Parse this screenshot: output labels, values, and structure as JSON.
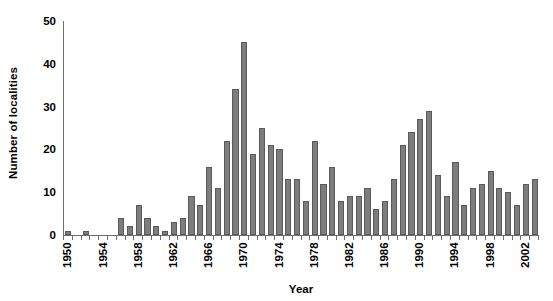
{
  "chart_data": {
    "type": "bar",
    "title": "",
    "xlabel": "Year",
    "ylabel": "Number of localities",
    "xlim": [
      1949.5,
      2003.5
    ],
    "ylim": [
      0,
      50
    ],
    "yticks": [
      0,
      10,
      20,
      30,
      40,
      50
    ],
    "xticks": [
      1950,
      1954,
      1958,
      1962,
      1966,
      1970,
      1974,
      1978,
      1982,
      1986,
      1990,
      1994,
      1998,
      2002
    ],
    "xtick_labels": [
      "1950",
      "1954",
      "1958",
      "1962",
      "1966",
      "1970",
      "1974",
      "1978",
      "1982",
      "1986",
      "1990",
      "1994",
      "1998",
      "2002"
    ],
    "ytick_labels": [
      "0",
      "10",
      "20",
      "30",
      "40",
      "50"
    ],
    "grid": false,
    "legend": null,
    "bar_color": "#7d7d7d",
    "bar_edge_color": "#5a5a5a",
    "axis_color": "#6e6e6e",
    "categories": [
      "1950",
      "1951",
      "1952",
      "1953",
      "1954",
      "1955",
      "1956",
      "1957",
      "1958",
      "1959",
      "1960",
      "1961",
      "1962",
      "1963",
      "1964",
      "1965",
      "1966",
      "1967",
      "1968",
      "1969",
      "1970",
      "1971",
      "1972",
      "1973",
      "1974",
      "1975",
      "1976",
      "1977",
      "1978",
      "1979",
      "1980",
      "1981",
      "1982",
      "1983",
      "1984",
      "1985",
      "1986",
      "1987",
      "1988",
      "1989",
      "1990",
      "1991",
      "1992",
      "1993",
      "1994",
      "1995",
      "1996",
      "1997",
      "1998",
      "1999",
      "2000",
      "2001",
      "2002",
      "2003"
    ],
    "values": [
      1,
      0,
      1,
      0,
      0,
      0,
      4,
      2,
      7,
      4,
      2,
      1,
      3,
      4,
      9,
      7,
      16,
      11,
      22,
      34,
      45,
      19,
      25,
      21,
      20,
      13,
      13,
      8,
      22,
      12,
      16,
      8,
      9,
      9,
      11,
      6,
      8,
      13,
      21,
      24,
      27,
      29,
      14,
      9,
      17,
      7,
      11,
      12,
      15,
      11,
      10,
      7,
      12,
      13
    ]
  }
}
